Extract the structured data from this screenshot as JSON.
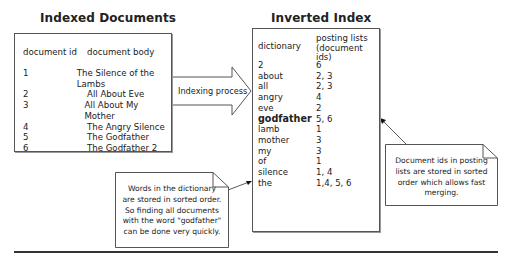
{
  "left_panel": {
    "title": "Indexed Documents",
    "header": {
      "id": "document id",
      "body": "document body"
    },
    "rows": [
      {
        "id": "1",
        "body": "The Silence of the Lambs"
      },
      {
        "id": "2",
        "body": "All About Eve"
      },
      {
        "id": "3",
        "body": "All About My Mother"
      },
      {
        "id": "4",
        "body": "The Angry Silence"
      },
      {
        "id": "5",
        "body": "The Godfather"
      },
      {
        "id": "6",
        "body": "The Godfather 2"
      }
    ]
  },
  "arrow": {
    "label": "Indexing process"
  },
  "right_panel": {
    "title": "Inverted Index",
    "header": {
      "term": "dictionary",
      "postings_line1": "posting lists",
      "postings_line2": "(document ids)"
    },
    "rows": [
      {
        "term": "2",
        "postings": "6"
      },
      {
        "term": "about",
        "postings": "2, 3"
      },
      {
        "term": "all",
        "postings": "2, 3"
      },
      {
        "term": "angry",
        "postings": "4"
      },
      {
        "term": "eve",
        "postings": "2"
      },
      {
        "term": "godfather",
        "postings": "5, 6",
        "bold": true
      },
      {
        "term": "lamb",
        "postings": "1"
      },
      {
        "term": "mother",
        "postings": "3"
      },
      {
        "term": "my",
        "postings": "3"
      },
      {
        "term": "of",
        "postings": "1"
      },
      {
        "term": "silence",
        "postings": "1, 4"
      },
      {
        "term": "the",
        "postings": "1,4, 5, 6"
      }
    ]
  },
  "notes": {
    "dictionary_note": [
      "Words in the dictionary",
      "are stored in sorted order.",
      "So finding all documents",
      "with the word \"godfather\"",
      "can be done very quickly."
    ],
    "postings_note": [
      "Document ids in posting",
      "lists are stored in sorted",
      "order which allows fast",
      "merging."
    ]
  }
}
